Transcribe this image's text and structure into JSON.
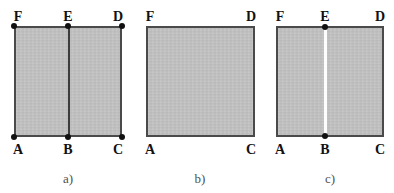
{
  "figure": {
    "name": "three-panel-rectangle-diagram",
    "background_color": "#ffffff",
    "fill_color": "#c3c3c3",
    "edge_color": "#4a4a4a",
    "divider_dark_color": "#3c3c3c",
    "divider_light_color": "#fdfdfd",
    "vertex_dot_color": "#111111",
    "label_color": "#111111",
    "caption_color": "#4f4f4f"
  },
  "panels": [
    {
      "id": "panel-a",
      "caption": "a)",
      "caption_x": 68,
      "caption_y": 172,
      "rect": {
        "x": 14,
        "y": 26,
        "w": 108,
        "h": 111
      },
      "divider": {
        "style": "dark",
        "x": 68
      },
      "labels": [
        {
          "text": "F",
          "x": 18,
          "y": 10,
          "position": "top"
        },
        {
          "text": "E",
          "x": 68,
          "y": 10,
          "position": "top"
        },
        {
          "text": "D",
          "x": 118,
          "y": 10,
          "position": "top"
        },
        {
          "text": "A",
          "x": 18,
          "y": 143,
          "position": "bottom"
        },
        {
          "text": "B",
          "x": 68,
          "y": 143,
          "position": "bottom"
        },
        {
          "text": "C",
          "x": 118,
          "y": 143,
          "position": "bottom"
        }
      ],
      "dots": [
        {
          "name": "vertex-F",
          "x": 14,
          "y": 26
        },
        {
          "name": "vertex-E",
          "x": 68,
          "y": 26
        },
        {
          "name": "vertex-D",
          "x": 122,
          "y": 26
        },
        {
          "name": "vertex-A",
          "x": 14,
          "y": 137
        },
        {
          "name": "vertex-B",
          "x": 68,
          "y": 137
        },
        {
          "name": "vertex-C",
          "x": 122,
          "y": 137
        }
      ]
    },
    {
      "id": "panel-b",
      "caption": "b)",
      "caption_x": 200,
      "caption_y": 172,
      "rect": {
        "x": 146,
        "y": 26,
        "w": 109,
        "h": 111
      },
      "divider": null,
      "labels": [
        {
          "text": "F",
          "x": 150,
          "y": 10,
          "position": "top"
        },
        {
          "text": "D",
          "x": 251,
          "y": 10,
          "position": "top"
        },
        {
          "text": "A",
          "x": 150,
          "y": 143,
          "position": "bottom"
        },
        {
          "text": "C",
          "x": 251,
          "y": 143,
          "position": "bottom"
        }
      ],
      "dots": []
    },
    {
      "id": "panel-c",
      "caption": "c)",
      "caption_x": 330,
      "caption_y": 172,
      "rect": {
        "x": 276,
        "y": 26,
        "w": 108,
        "h": 111
      },
      "divider": {
        "style": "light",
        "x": 324
      },
      "labels": [
        {
          "text": "F",
          "x": 280,
          "y": 10,
          "position": "top"
        },
        {
          "text": "E",
          "x": 325,
          "y": 10,
          "position": "top"
        },
        {
          "text": "D",
          "x": 380,
          "y": 10,
          "position": "top"
        },
        {
          "text": "A",
          "x": 280,
          "y": 143,
          "position": "bottom"
        },
        {
          "text": "B",
          "x": 325,
          "y": 143,
          "position": "bottom"
        },
        {
          "text": "C",
          "x": 380,
          "y": 143,
          "position": "bottom"
        }
      ],
      "dots": [
        {
          "name": "vertex-E",
          "x": 325,
          "y": 27
        },
        {
          "name": "vertex-B",
          "x": 325,
          "y": 136
        }
      ]
    }
  ]
}
